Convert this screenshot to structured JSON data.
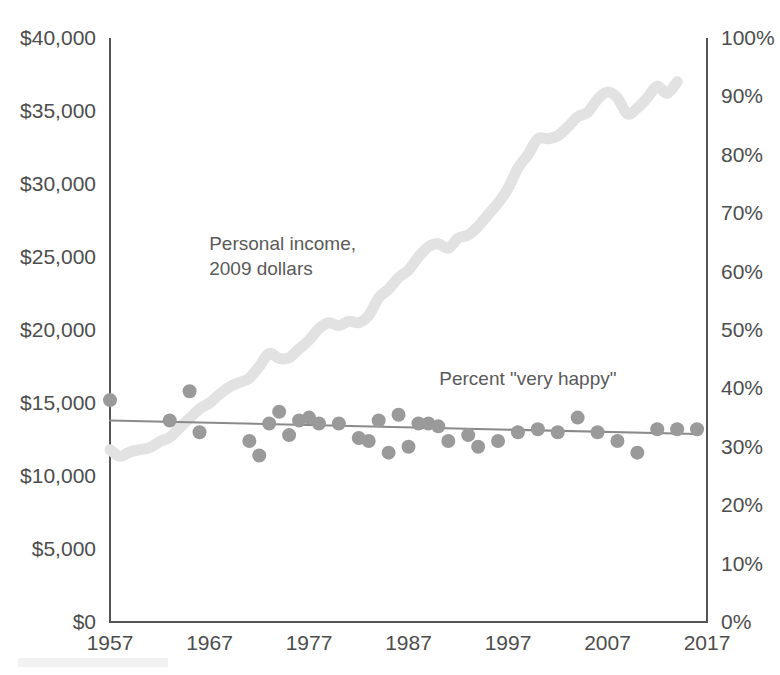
{
  "chart_data": {
    "type": "line",
    "title": "",
    "subtitle": "",
    "xlabel": "",
    "ylabel": "",
    "grid": false,
    "legend_position": "inline-annotations",
    "x": [
      1957,
      2017
    ],
    "xlim": [
      1957,
      2017
    ],
    "x_ticks": [
      "1957",
      "1967",
      "1977",
      "1987",
      "1997",
      "2007",
      "2017"
    ],
    "x_tick_values": [
      1957,
      1967,
      1977,
      1987,
      1997,
      2007,
      2017
    ],
    "axis_left": {
      "label": "Personal income, 2009 dollars",
      "ylim": [
        0,
        40000
      ],
      "ticks": [
        "$0",
        "$5,000",
        "$10,000",
        "$15,000",
        "$20,000",
        "$25,000",
        "$30,000",
        "$35,000",
        "$40,000"
      ],
      "tick_values": [
        0,
        5000,
        10000,
        15000,
        20000,
        25000,
        30000,
        35000,
        40000
      ]
    },
    "axis_right": {
      "label": "Percent \"very happy\"",
      "ylim": [
        0,
        100
      ],
      "ticks": [
        "0%",
        "10%",
        "20%",
        "30%",
        "40%",
        "50%",
        "60%",
        "70%",
        "80%",
        "90%",
        "100%"
      ],
      "tick_values": [
        0,
        10,
        20,
        30,
        40,
        50,
        60,
        70,
        80,
        90,
        100
      ]
    },
    "series": [
      {
        "name": "Personal income, 2009 dollars",
        "type": "line",
        "axis": "left",
        "color": "#e2e2e2",
        "stroke_width": 11,
        "x": [
          1957,
          1958,
          1959,
          1960,
          1961,
          1962,
          1963,
          1964,
          1965,
          1966,
          1967,
          1968,
          1969,
          1970,
          1971,
          1972,
          1973,
          1974,
          1975,
          1976,
          1977,
          1978,
          1979,
          1980,
          1981,
          1982,
          1983,
          1984,
          1985,
          1986,
          1987,
          1988,
          1989,
          1990,
          1991,
          1992,
          1993,
          1994,
          1995,
          1996,
          1997,
          1998,
          1999,
          2000,
          2001,
          2002,
          2003,
          2004,
          2005,
          2006,
          2007,
          2008,
          2009,
          2010,
          2011,
          2012,
          2013,
          2014
        ],
        "values": [
          11800,
          11350,
          11650,
          11800,
          11950,
          12350,
          12650,
          13300,
          13950,
          14600,
          15000,
          15600,
          16100,
          16400,
          16700,
          17500,
          18400,
          18050,
          18100,
          18700,
          19300,
          20100,
          20500,
          20300,
          20600,
          20500,
          21000,
          22200,
          22800,
          23600,
          24100,
          25000,
          25700,
          25900,
          25600,
          26300,
          26500,
          27100,
          27900,
          28700,
          29700,
          31100,
          32000,
          33100,
          33100,
          33300,
          33900,
          34600,
          34900,
          35800,
          36300,
          35900,
          34800,
          35200,
          35900,
          36700,
          36200,
          37000
        ]
      },
      {
        "name": "Percent \"very happy\"",
        "type": "scatter",
        "axis": "right",
        "color": "#9a9a9a",
        "marker_radius": 7,
        "points": [
          {
            "x": 1957,
            "y": 38.0
          },
          {
            "x": 1963,
            "y": 34.5
          },
          {
            "x": 1965,
            "y": 39.5
          },
          {
            "x": 1966,
            "y": 32.5
          },
          {
            "x": 1971,
            "y": 31.0
          },
          {
            "x": 1972,
            "y": 28.5
          },
          {
            "x": 1973,
            "y": 34.0
          },
          {
            "x": 1974,
            "y": 36.0
          },
          {
            "x": 1975,
            "y": 32.0
          },
          {
            "x": 1976,
            "y": 34.5
          },
          {
            "x": 1977,
            "y": 35.0
          },
          {
            "x": 1978,
            "y": 34.0
          },
          {
            "x": 1980,
            "y": 34.0
          },
          {
            "x": 1982,
            "y": 31.5
          },
          {
            "x": 1983,
            "y": 31.0
          },
          {
            "x": 1984,
            "y": 34.5
          },
          {
            "x": 1985,
            "y": 29.0
          },
          {
            "x": 1986,
            "y": 35.5
          },
          {
            "x": 1987,
            "y": 30.0
          },
          {
            "x": 1988,
            "y": 34.0
          },
          {
            "x": 1989,
            "y": 34.0
          },
          {
            "x": 1990,
            "y": 33.5
          },
          {
            "x": 1991,
            "y": 31.0
          },
          {
            "x": 1993,
            "y": 32.0
          },
          {
            "x": 1994,
            "y": 30.0
          },
          {
            "x": 1996,
            "y": 31.0
          },
          {
            "x": 1998,
            "y": 32.5
          },
          {
            "x": 2000,
            "y": 33.0
          },
          {
            "x": 2002,
            "y": 32.5
          },
          {
            "x": 2004,
            "y": 35.0
          },
          {
            "x": 2006,
            "y": 32.5
          },
          {
            "x": 2008,
            "y": 31.0
          },
          {
            "x": 2010,
            "y": 29.0
          },
          {
            "x": 2012,
            "y": 33.0
          },
          {
            "x": 2014,
            "y": 33.0
          },
          {
            "x": 2016,
            "y": 33.0
          }
        ]
      },
      {
        "name": "Percent \"very happy\" trend",
        "type": "line",
        "axis": "right",
        "color": "#8a8a8a",
        "stroke_width": 2,
        "x": [
          1957,
          2016
        ],
        "values": [
          34.5,
          32.2
        ]
      }
    ],
    "annotations": [
      {
        "name": "income-annotation",
        "text_lines": [
          "Personal income,",
          "2009 dollars"
        ],
        "x": 1973,
        "y_left": 25500
      },
      {
        "name": "happy-annotation",
        "text_lines": [
          "Percent \"very happy\""
        ],
        "x": 1999,
        "y_right": 40.5
      }
    ]
  },
  "labels": {
    "income_line_1": "Personal income,",
    "income_line_2": "2009 dollars",
    "happy": "Percent \"very happy\""
  },
  "colors": {
    "income_line": "#e2e2e2",
    "scatter": "#9a9a9a",
    "trend_line": "#8a8a8a",
    "axis": "#555555",
    "text": "#4d4d4d"
  }
}
